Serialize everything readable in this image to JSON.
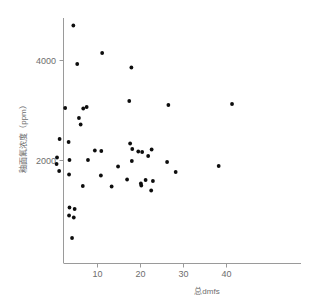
{
  "chart_data": {
    "type": "scatter",
    "title": "",
    "xlabel": "总dmfs",
    "ylabel": "釉面氟浓度（ppm）",
    "xticks": [
      10,
      20,
      30,
      40
    ],
    "yticks": [
      2000,
      4000
    ],
    "xlim": [
      0,
      49
    ],
    "ylim": [
      0,
      5100
    ],
    "grid": false,
    "legend": null,
    "marker": "filled-circle",
    "marker_color": "#0d0d0d",
    "points": [
      {
        "x": 4.5,
        "y": 4700
      },
      {
        "x": 11.2,
        "y": 4150
      },
      {
        "x": 5.4,
        "y": 3930
      },
      {
        "x": 18.0,
        "y": 3860
      },
      {
        "x": 17.5,
        "y": 3190
      },
      {
        "x": 41.4,
        "y": 3130
      },
      {
        "x": 26.6,
        "y": 3110
      },
      {
        "x": 7.6,
        "y": 3070
      },
      {
        "x": 2.6,
        "y": 3050
      },
      {
        "x": 6.8,
        "y": 3040
      },
      {
        "x": 5.8,
        "y": 2850
      },
      {
        "x": 6.2,
        "y": 2720
      },
      {
        "x": 1.3,
        "y": 2430
      },
      {
        "x": 3.4,
        "y": 2370
      },
      {
        "x": 17.7,
        "y": 2340
      },
      {
        "x": 18.2,
        "y": 2230
      },
      {
        "x": 22.7,
        "y": 2220
      },
      {
        "x": 9.5,
        "y": 2200
      },
      {
        "x": 11.0,
        "y": 2190
      },
      {
        "x": 19.6,
        "y": 2180
      },
      {
        "x": 20.5,
        "y": 2170
      },
      {
        "x": 21.9,
        "y": 2090
      },
      {
        "x": 0.7,
        "y": 2060
      },
      {
        "x": 3.6,
        "y": 2010
      },
      {
        "x": 7.9,
        "y": 2010
      },
      {
        "x": 18.1,
        "y": 1990
      },
      {
        "x": 26.3,
        "y": 1970
      },
      {
        "x": 0.6,
        "y": 1930
      },
      {
        "x": 38.3,
        "y": 1890
      },
      {
        "x": 14.9,
        "y": 1880
      },
      {
        "x": 1.2,
        "y": 1790
      },
      {
        "x": 28.3,
        "y": 1770
      },
      {
        "x": 3.5,
        "y": 1720
      },
      {
        "x": 10.9,
        "y": 1700
      },
      {
        "x": 17.0,
        "y": 1620
      },
      {
        "x": 21.3,
        "y": 1610
      },
      {
        "x": 23.0,
        "y": 1590
      },
      {
        "x": 20.2,
        "y": 1540
      },
      {
        "x": 20.3,
        "y": 1500
      },
      {
        "x": 6.7,
        "y": 1490
      },
      {
        "x": 13.4,
        "y": 1480
      },
      {
        "x": 22.6,
        "y": 1400
      },
      {
        "x": 3.6,
        "y": 1060
      },
      {
        "x": 4.8,
        "y": 1030
      },
      {
        "x": 3.5,
        "y": 900
      },
      {
        "x": 4.6,
        "y": 860
      },
      {
        "x": 4.2,
        "y": 450
      }
    ]
  },
  "axes": {
    "x_tick_labels": [
      "10",
      "20",
      "30",
      "40"
    ],
    "y_tick_labels": [
      "2000",
      "4000"
    ]
  }
}
